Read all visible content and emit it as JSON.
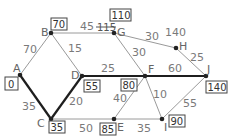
{
  "diagram": {
    "type": "weighted-graph-dijkstra",
    "nodes": [
      {
        "id": "A",
        "label": "A",
        "x": 20,
        "y": 75,
        "distance": "0"
      },
      {
        "id": "B",
        "label": "B",
        "x": 51,
        "y": 33,
        "distance": "70"
      },
      {
        "id": "C",
        "label": "C",
        "x": 51,
        "y": 119,
        "distance": "35"
      },
      {
        "id": "D",
        "label": "D",
        "x": 82,
        "y": 76,
        "distance": "55"
      },
      {
        "id": "E",
        "label": "E",
        "x": 114,
        "y": 119,
        "distance": "85"
      },
      {
        "id": "F",
        "label": "F",
        "x": 145,
        "y": 76,
        "distance": "80"
      },
      {
        "id": "G",
        "label": "G",
        "x": 114,
        "y": 33,
        "distance": "110",
        "crossed_out": "115"
      },
      {
        "id": "H",
        "label": "H",
        "x": 176,
        "y": 48,
        "distance": "140"
      },
      {
        "id": "I",
        "label": "I",
        "x": 162,
        "y": 119,
        "distance": "90"
      },
      {
        "id": "J",
        "label": "J",
        "x": 206,
        "y": 76,
        "distance": "140"
      }
    ],
    "edges": [
      {
        "from": "A",
        "to": "B",
        "weight": "70",
        "bold": false
      },
      {
        "from": "A",
        "to": "C",
        "weight": "35",
        "bold": true
      },
      {
        "from": "B",
        "to": "D",
        "weight": "15",
        "bold": false
      },
      {
        "from": "B",
        "to": "G",
        "weight": "45",
        "bold": false
      },
      {
        "from": "C",
        "to": "D",
        "weight": "20",
        "bold": true
      },
      {
        "from": "C",
        "to": "E",
        "weight": "50",
        "bold": false
      },
      {
        "from": "D",
        "to": "F",
        "weight": "25",
        "bold": true
      },
      {
        "from": "E",
        "to": "F",
        "weight": "40",
        "bold": false
      },
      {
        "from": "E",
        "to": "I",
        "weight": "35",
        "bold": false
      },
      {
        "from": "F",
        "to": "G",
        "weight": "30",
        "bold": false
      },
      {
        "from": "F",
        "to": "I",
        "weight": "10",
        "bold": false
      },
      {
        "from": "F",
        "to": "J",
        "weight": "60",
        "bold": true
      },
      {
        "from": "G",
        "to": "H",
        "weight": "30",
        "bold": false
      },
      {
        "from": "H",
        "to": "J",
        "weight": "25",
        "bold": false
      },
      {
        "from": "I",
        "to": "J",
        "weight": "55",
        "bold": false
      }
    ],
    "colors": {
      "edge": "#9a9a9a",
      "bold_edge": "#1e1e1e",
      "node": "#222222",
      "background": "#ffffff"
    }
  }
}
